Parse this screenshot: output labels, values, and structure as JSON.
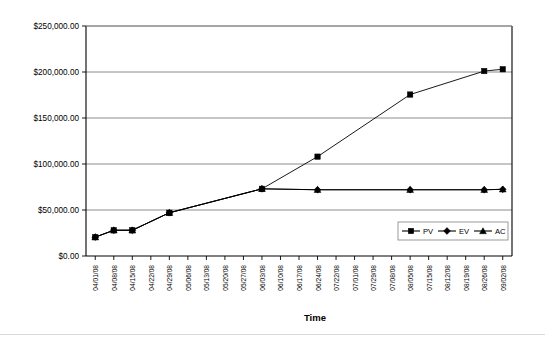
{
  "chart_data": {
    "type": "line",
    "title": "",
    "xlabel": "Time",
    "ylabel": "",
    "ylim": [
      0,
      250000
    ],
    "ytick_step": 50000,
    "ytick_labels": [
      "$0.00",
      "$50,000.00",
      "$100,000.00",
      "$150,000.00",
      "$200,000.00",
      "$250,000.00"
    ],
    "ytick_values": [
      0,
      50000,
      100000,
      150000,
      200000,
      250000
    ],
    "grid": true,
    "legend_position": "inside-lower-right",
    "categories": [
      "04/01/08",
      "04/08/08",
      "04/15/08",
      "04/22/08",
      "04/29/08",
      "05/06/08",
      "05/13/08",
      "05/20/08",
      "05/27/08",
      "06/03/08",
      "06/10/08",
      "06/17/08",
      "06/24/08",
      "07/22/08",
      "07/01/08",
      "07/29/08",
      "07/08/08",
      "08/05/08",
      "07/15/08",
      "08/12/08",
      "08/19/08",
      "08/26/08",
      "09/02/08"
    ],
    "series": [
      {
        "name": "PV",
        "marker": "square",
        "color": "#000000",
        "x": [
          0,
          1,
          2,
          4,
          9,
          12,
          17,
          21,
          22
        ],
        "values": [
          20500,
          28000,
          28000,
          47000,
          73000,
          108000,
          175500,
          201000,
          203000
        ]
      },
      {
        "name": "EV",
        "marker": "diamond",
        "color": "#000000",
        "x": [
          0,
          1,
          2,
          4,
          9,
          12,
          17,
          21,
          22
        ],
        "values": [
          20500,
          28000,
          28000,
          47000,
          73000,
          72000,
          72000,
          72000,
          72500
        ]
      },
      {
        "name": "AC",
        "marker": "triangle",
        "color": "#000000",
        "x": [
          0,
          1,
          2,
          4,
          9,
          12,
          17,
          21,
          22
        ],
        "values": [
          20500,
          28000,
          28000,
          47000,
          73000,
          72000,
          72000,
          72000,
          72500
        ]
      }
    ]
  },
  "legend": {
    "entries": [
      {
        "label": "PV",
        "marker": "square"
      },
      {
        "label": "EV",
        "marker": "diamond"
      },
      {
        "label": "AC",
        "marker": "triangle"
      }
    ]
  },
  "axis_titles": {
    "x": "Time"
  },
  "colors": {
    "series": "#000000",
    "grid": "#808080",
    "frame": "#000000",
    "background": "#ffffff"
  }
}
